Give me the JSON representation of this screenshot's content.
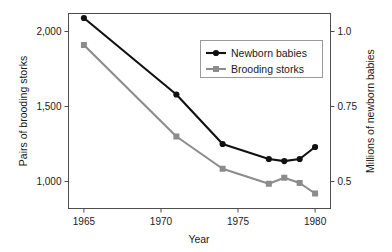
{
  "chart_data": {
    "type": "line",
    "title": "",
    "xlabel": "Year",
    "x": [
      1965,
      1971,
      1974,
      1977,
      1978,
      1979,
      1980
    ],
    "xlim": [
      1964,
      1981
    ],
    "xticks": [
      1965,
      1970,
      1975,
      1980
    ],
    "xtick_labels": [
      "1965",
      "1970",
      "1975",
      "1980"
    ],
    "grid": false,
    "legend_position": "upper-right",
    "axes": {
      "left": {
        "label": "Pairs of brooding storks",
        "ticks": [
          1000,
          1500,
          2000
        ],
        "tick_labels": [
          "1,000",
          "1,500",
          "2,000"
        ],
        "lim": [
          820,
          2120
        ]
      },
      "right": {
        "label": "Millions of newborn babies",
        "ticks": [
          0.5,
          0.75,
          1.0
        ],
        "tick_labels": [
          "0.5",
          "0.75",
          "1.0"
        ],
        "lim": [
          0.41,
          1.06
        ]
      }
    },
    "series": [
      {
        "name": "Newborn babies",
        "axis": "right",
        "color": "#111111",
        "marker": "circle",
        "values": [
          1.045,
          0.79,
          0.625,
          0.575,
          0.568,
          0.575,
          0.615
        ]
      },
      {
        "name": "Brooding storks",
        "axis": "left",
        "color": "#8c8c8c",
        "marker": "square",
        "values": [
          1910,
          1300,
          1085,
          985,
          1025,
          990,
          920
        ]
      }
    ],
    "legend": [
      {
        "label": "Newborn babies",
        "color": "#111111",
        "marker": "circle"
      },
      {
        "label": "Brooding storks",
        "color": "#8c8c8c",
        "marker": "square"
      }
    ]
  }
}
